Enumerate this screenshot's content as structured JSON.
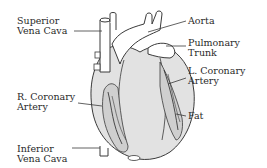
{
  "diagram": {
    "colors": {
      "heart_fill": "#e2e2e2",
      "outline": "#3a3a3a",
      "vessel_fill": "#ffffff",
      "fat_fill": "#cfcfcf",
      "text": "#2a2a2a",
      "background": "#ffffff"
    },
    "labels": {
      "superior_vena_cava": {
        "line1": "Superior",
        "line2": "Vena Cava"
      },
      "aorta": {
        "line1": "Aorta"
      },
      "pulmonary_trunk": {
        "line1": "Pulmonary",
        "line2": "Trunk"
      },
      "l_coronary_artery": {
        "line1": "L. Coronary",
        "line2": "Artery"
      },
      "r_coronary_artery": {
        "line1": "R. Coronary",
        "line2": "Artery"
      },
      "fat": {
        "line1": "Fat"
      },
      "inferior_vena_cava": {
        "line1": "Inferior",
        "line2": "Vena Cava"
      }
    }
  }
}
